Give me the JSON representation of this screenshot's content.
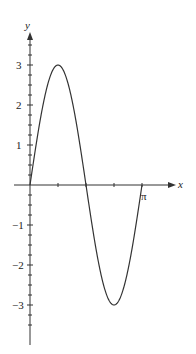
{
  "chart_data": {
    "type": "line",
    "title": "",
    "function": "y = 3 sin(2x)",
    "xlabel": "x",
    "ylabel": "y",
    "xlim": [
      0,
      3.14159
    ],
    "ylim": [
      -3.5,
      3.5
    ],
    "x_tick_labels": [
      "π"
    ],
    "y_tick_labels": [
      "3",
      "2",
      "1",
      "-1",
      "-2",
      "-3"
    ],
    "grid": false,
    "x": [
      0,
      0.3927,
      0.7854,
      1.1781,
      1.5708,
      1.9635,
      2.3562,
      2.7489,
      3.1416
    ],
    "series": [
      {
        "name": "y = 3 sin 2x",
        "values": [
          0,
          2.12,
          3,
          2.12,
          0,
          -2.12,
          -3,
          -2.12,
          0
        ]
      }
    ]
  },
  "labels": {
    "x_axis": "x",
    "y_axis": "y",
    "pi": "π",
    "y3": "3",
    "y2": "2",
    "y1": "1",
    "ym1": "−1",
    "ym2": "−2",
    "ym3": "−3"
  }
}
